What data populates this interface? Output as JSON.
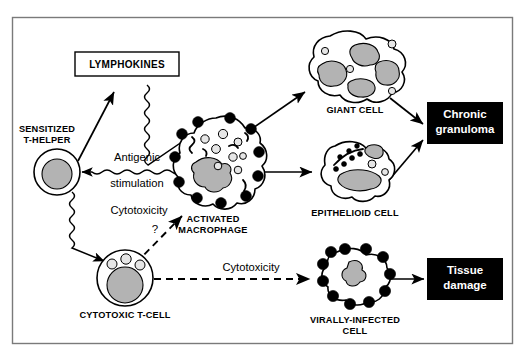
{
  "figure": {
    "frame": {
      "stroke_color": "#7a7a7a"
    }
  },
  "boxes": {
    "lymphokines": {
      "label": "LYMPHOKINES",
      "style": "outlined",
      "fill": "#ffffff",
      "text_color": "#000000"
    },
    "chronic_granuloma": {
      "line1": "Chronic",
      "line2": "granuloma",
      "style": "filled",
      "fill": "#000000",
      "text_color": "#ffffff"
    },
    "tissue_damage": {
      "line1": "Tissue",
      "line2": "damage",
      "style": "filled",
      "fill": "#000000",
      "text_color": "#ffffff"
    }
  },
  "cells": {
    "sensitized_t_helper": {
      "line1": "SENSITIZED",
      "line2": "T-HELPER",
      "nucleus_color": "#b3b3b3"
    },
    "activated_macrophage": {
      "line1": "ACTIVATED",
      "line2": "MACROPHAGE",
      "nucleus_color": "#b3b3b3"
    },
    "cytotoxic_t_cell": {
      "line1": "CYTOTOXIC T-CELL",
      "line2": "",
      "nucleus_color": "#b3b3b3"
    },
    "giant_cell": {
      "line1": "GIANT CELL",
      "line2": "",
      "nucleus_color": "#b3b3b3"
    },
    "epithelioid_cell": {
      "line1": "EPITHELIOID CELL",
      "line2": "",
      "nucleus_color": "#b3b3b3"
    },
    "virally_infected_cell": {
      "line1": "VIRALLY-INFECTED",
      "line2": "CELL",
      "nucleus_color": "#b3b3b3"
    }
  },
  "edge_labels": {
    "antigenic_stimulation_line1": "Antigenic",
    "antigenic_stimulation_line2": "stimulation",
    "cytotoxicity_macrophage": "Cytotoxicity",
    "cytotoxicity_question": "?",
    "cytotoxicity_virally_infected": "Cytotoxicity"
  }
}
